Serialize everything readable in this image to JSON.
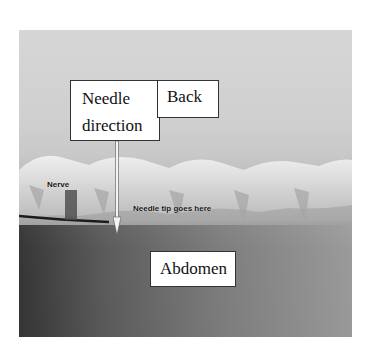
{
  "figure": {
    "type": "annotated-photo",
    "labels": {
      "needle_direction_line1": "Needle",
      "needle_direction_line2": "direction",
      "back": "Back",
      "abdomen": "Abdomen",
      "nerve": "Nerve",
      "needle_tip": "Needle tip goes here"
    },
    "arrow": {
      "direction": "down",
      "meaning": "needle direction"
    }
  }
}
